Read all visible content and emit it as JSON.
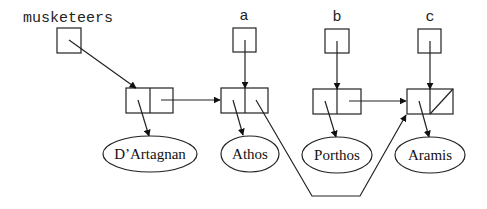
{
  "diagram": {
    "title": "",
    "variables": [
      {
        "id": "musketeers",
        "label": "musketeers"
      },
      {
        "id": "a",
        "label": "a"
      },
      {
        "id": "b",
        "label": "b"
      },
      {
        "id": "c",
        "label": "c"
      }
    ],
    "nodes": [
      {
        "id": "dartagnan",
        "label": "D’Artagnan"
      },
      {
        "id": "athos",
        "label": "Athos"
      },
      {
        "id": "porthos",
        "label": "Porthos"
      },
      {
        "id": "aramis",
        "label": "Aramis"
      }
    ],
    "cells": [
      {
        "id": "cell1",
        "car": "dartagnan",
        "cdr": "cell2"
      },
      {
        "id": "cell2",
        "car": "athos",
        "cdr": "cell4"
      },
      {
        "id": "cell3",
        "car": "porthos",
        "cdr": "cell4"
      },
      {
        "id": "cell4",
        "car": "aramis",
        "cdr": "null"
      }
    ],
    "edges": [
      {
        "from": "musketeers",
        "to": "cell1"
      },
      {
        "from": "a",
        "to": "cell2"
      },
      {
        "from": "b",
        "to": "cell3"
      },
      {
        "from": "c",
        "to": "cell4"
      },
      {
        "from": "cell1.cdr",
        "to": "cell2"
      },
      {
        "from": "cell2.cdr",
        "to": "cell4"
      },
      {
        "from": "cell3.cdr",
        "to": "cell4"
      },
      {
        "from": "cell1.car",
        "to": "dartagnan"
      },
      {
        "from": "cell2.car",
        "to": "athos"
      },
      {
        "from": "cell3.car",
        "to": "porthos"
      },
      {
        "from": "cell4.car",
        "to": "aramis"
      }
    ],
    "colors": {
      "stroke": "#222222",
      "background": "#ffffff"
    }
  }
}
